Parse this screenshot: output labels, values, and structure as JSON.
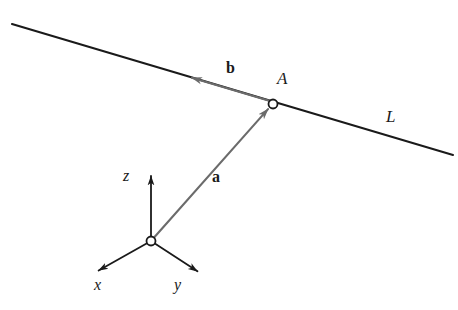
{
  "figure": {
    "background_color": "#ffffff",
    "line_color": "#1a1a1a",
    "vector_color": "#6b6b6b",
    "marker_fill": "#ffffff",
    "marker_stroke": "#1a1a1a"
  },
  "labels": {
    "vector_b": "b",
    "vector_a": "a",
    "point_A": "A",
    "line_L": "L",
    "axis_x": "x",
    "axis_y": "y",
    "axis_z": "z"
  },
  "geometry": {
    "line_L": {
      "x1": 12,
      "y1": 24,
      "x2": 453,
      "y2": 155
    },
    "point_A": {
      "x": 273,
      "y": 104,
      "radius": 4.5
    },
    "origin": {
      "x": 151,
      "y": 241,
      "radius": 4.5
    },
    "vector_a": {
      "x1": 151,
      "y1": 241,
      "x2": 269,
      "y2": 108
    },
    "vector_b": {
      "x1": 270,
      "y1": 101,
      "x2": 189,
      "y2": 77
    },
    "axis_x": {
      "x1": 151,
      "y1": 241,
      "x2": 96,
      "y2": 272
    },
    "axis_y": {
      "x1": 151,
      "y1": 241,
      "x2": 200,
      "y2": 273
    },
    "axis_z": {
      "x1": 151,
      "y1": 241,
      "x2": 151,
      "y2": 173
    }
  }
}
